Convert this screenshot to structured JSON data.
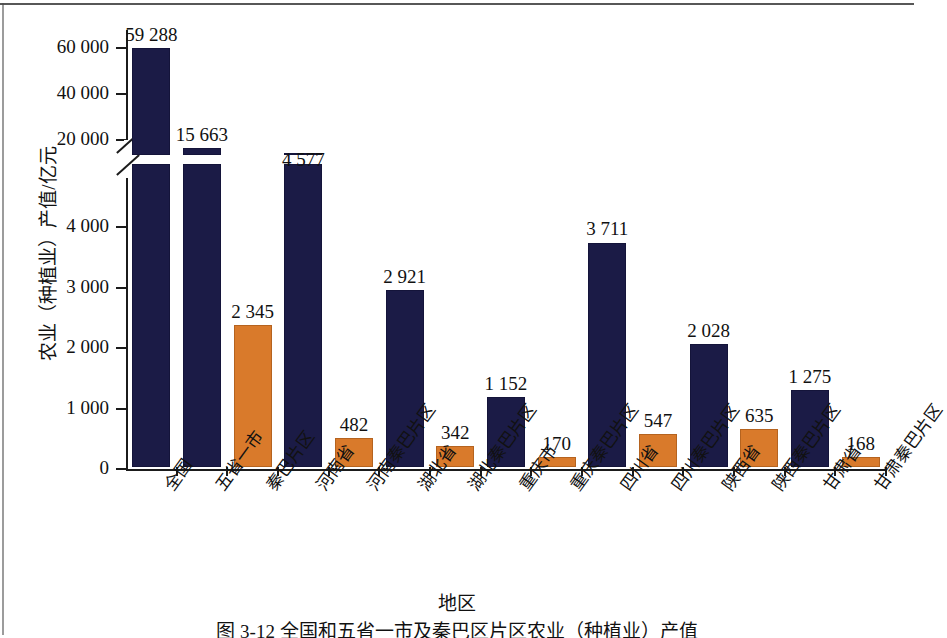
{
  "chart_data": {
    "type": "bar",
    "title": "",
    "xlabel": "地区",
    "ylabel": "农业（种植业）产值/亿元",
    "categories": [
      "全国",
      "五省一市",
      "秦巴片区",
      "河南省",
      "河南秦巴片区",
      "湖北省",
      "湖北秦巴片区",
      "重庆市",
      "重庆秦巴片区",
      "四川省",
      "四川秦巴片区",
      "陕西省",
      "陕西秦巴片区",
      "甘肃省",
      "甘肃秦巴片区"
    ],
    "values": [
      59288,
      15663,
      2345,
      4577,
      482,
      2921,
      342,
      1152,
      170,
      3711,
      547,
      2028,
      635,
      1275,
      168
    ],
    "value_labels": [
      "59 288",
      "15 663",
      "2 345",
      "4 577",
      "482",
      "2 921",
      "342",
      "1 152",
      "170",
      "3 711",
      "547",
      "2 028",
      "635",
      "1 275",
      "168"
    ],
    "series_kind": [
      "province",
      "province",
      "qinba",
      "province",
      "qinba",
      "province",
      "qinba",
      "province",
      "qinba",
      "province",
      "qinba",
      "province",
      "qinba",
      "province",
      "qinba"
    ],
    "ytick_labels": [
      "0",
      "1 000",
      "2 000",
      "3 000",
      "4 000",
      "20 000",
      "40 000",
      "60 000"
    ],
    "ytick_values": [
      0,
      1000,
      2000,
      3000,
      4000,
      20000,
      40000,
      60000
    ],
    "axis_break": true,
    "axis_break_between": [
      4000,
      20000
    ],
    "ylim_lower": [
      0,
      4000
    ],
    "ylim_upper": [
      20000,
      63000
    ],
    "grid": false,
    "legend": "none",
    "colors": {
      "province_bar": "#1b1b46",
      "qinba_bar": "#d97a2b",
      "axis": "#1b1b1b",
      "text": "#111111",
      "background": "#ffffff"
    }
  },
  "figure": {
    "xlabel": "地区",
    "ylabel": "农业（种植业）产值/亿元",
    "caption": "图 3-12  全国和五省一市及秦巴区片区农业（种植业）产值"
  }
}
